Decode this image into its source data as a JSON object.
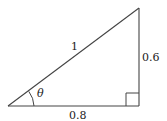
{
  "diagram": {
    "type": "right-triangle",
    "labels": {
      "hypotenuse": "1",
      "vertical_side": "0.6",
      "horizontal_side": "0.8",
      "angle": "θ"
    },
    "colors": {
      "stroke": "#444444",
      "text": "#222222"
    }
  }
}
